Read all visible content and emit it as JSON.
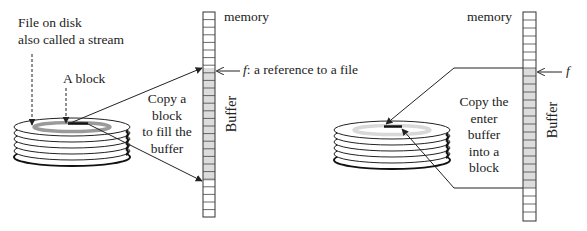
{
  "left_panel": {
    "file_label_line1": "File on disk",
    "file_label_line2": "also called a stream",
    "block_label": "A block",
    "copy_text": [
      "Copy a",
      "block",
      "to fill the",
      "buffer"
    ],
    "memory_label": "memory",
    "buffer_label": "Buffer",
    "ref_symbol": "f",
    "ref_text": ": a reference to a file"
  },
  "right_panel": {
    "memory_label": "memory",
    "buffer_label": "Buffer",
    "ref_symbol": "f",
    "copy_text": [
      "Copy the",
      "enter",
      "buffer",
      "into a",
      "block"
    ]
  },
  "colors": {
    "line": "#222222",
    "buffer_fill": "#dcdcdc",
    "track_left": "#9a9a9a",
    "track_right": "#d8d8d8"
  }
}
